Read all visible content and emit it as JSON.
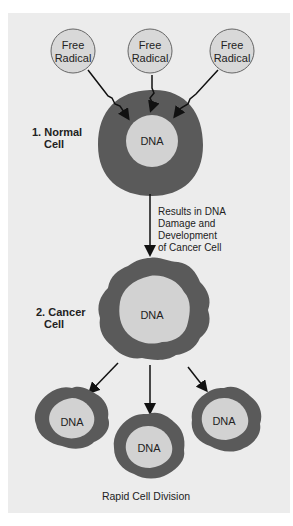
{
  "figure": {
    "free_radicals": [
      {
        "label_line1": "Free",
        "label_line2": "Radical"
      },
      {
        "label_line1": "Free",
        "label_line2": "Radical"
      },
      {
        "label_line1": "Free",
        "label_line2": "Radical"
      }
    ],
    "normal_cell": {
      "label_line1": "1. Normal",
      "label_line2": "Cell",
      "nucleus": "DNA"
    },
    "transition_text": [
      "Results in DNA",
      "Damage and",
      "Development",
      "of Cancer Cell"
    ],
    "cancer_cell": {
      "label_line1": "2. Cancer",
      "label_line2": "Cell",
      "nucleus": "DNA"
    },
    "daughter_cells": [
      {
        "nucleus": "DNA"
      },
      {
        "nucleus": "DNA"
      },
      {
        "nucleus": "DNA"
      }
    ],
    "caption": "Rapid Cell Division"
  },
  "colors": {
    "background": "#ececec",
    "cell_membrane": "#5a5a5a",
    "nucleus": "#d2d2d2",
    "radical": "#d8d8d8",
    "arrow": "#111111"
  }
}
